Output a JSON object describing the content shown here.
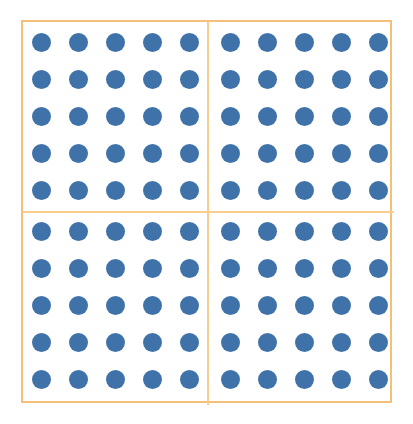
{
  "figure": {
    "title": "",
    "type": "dot-array",
    "background_color": "#ffffff"
  },
  "chart_data": {
    "type": "scatter",
    "title": "",
    "subtitle": "",
    "xlabel": "",
    "ylabel": "",
    "grid": false,
    "legend": null,
    "legend_position": "none",
    "marker": "filled-circle",
    "marker_color": "#3f72a8",
    "marker_diameter_px": 19,
    "rows": 10,
    "columns": 10,
    "total_dots": 100,
    "row_spacing_px": 37,
    "column_spacing_px": 37,
    "xlim": [
      0,
      9
    ],
    "ylim": [
      0,
      9
    ],
    "x": [
      0,
      1,
      2,
      3,
      4,
      5,
      6,
      7,
      8,
      9
    ],
    "y": [
      0,
      1,
      2,
      3,
      4,
      5,
      6,
      7,
      8,
      9
    ],
    "values": [
      [
        1,
        1,
        1,
        1,
        1,
        1,
        1,
        1,
        1,
        1
      ],
      [
        1,
        1,
        1,
        1,
        1,
        1,
        1,
        1,
        1,
        1
      ],
      [
        1,
        1,
        1,
        1,
        1,
        1,
        1,
        1,
        1,
        1
      ],
      [
        1,
        1,
        1,
        1,
        1,
        1,
        1,
        1,
        1,
        1
      ],
      [
        1,
        1,
        1,
        1,
        1,
        1,
        1,
        1,
        1,
        1
      ],
      [
        1,
        1,
        1,
        1,
        1,
        1,
        1,
        1,
        1,
        1
      ],
      [
        1,
        1,
        1,
        1,
        1,
        1,
        1,
        1,
        1,
        1
      ],
      [
        1,
        1,
        1,
        1,
        1,
        1,
        1,
        1,
        1,
        1
      ],
      [
        1,
        1,
        1,
        1,
        1,
        1,
        1,
        1,
        1,
        1
      ],
      [
        1,
        1,
        1,
        1,
        1,
        1,
        1,
        1,
        1,
        1
      ]
    ],
    "quadrants": [
      {
        "name": "top-left",
        "rows": 5,
        "columns": 5,
        "dot_count": 25
      },
      {
        "name": "top-right",
        "rows": 5,
        "columns": 5,
        "dot_count": 25
      },
      {
        "name": "bottom-left",
        "rows": 5,
        "columns": 5,
        "dot_count": 25
      },
      {
        "name": "bottom-right",
        "rows": 5,
        "columns": 5,
        "dot_count": 25
      }
    ],
    "colors": {
      "dot": "#3f72a8",
      "frame": "#f3bf79",
      "divider": "#f9cd8d",
      "background": "#ffffff"
    }
  },
  "annotations": {
    "labels": [],
    "tick_labels_x": [],
    "tick_labels_y": []
  }
}
